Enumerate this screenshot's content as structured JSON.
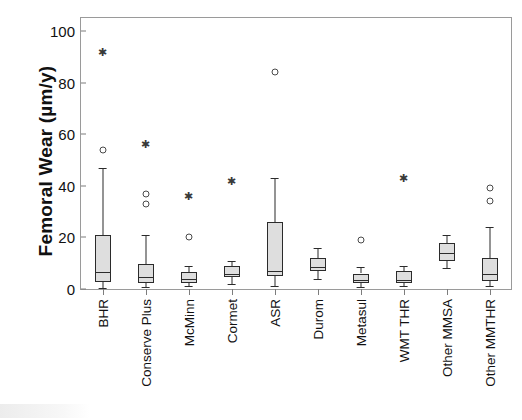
{
  "chart_data": {
    "type": "box",
    "title": "",
    "xlabel": "",
    "ylabel": "Femoral Wear (µm/y)",
    "ylim": [
      0,
      105
    ],
    "yticks": [
      0,
      20,
      40,
      60,
      80,
      100
    ],
    "ytick_labels": [
      "0",
      "20",
      "40",
      "60",
      "80",
      "100"
    ],
    "grid": false,
    "legend": "none",
    "categories": [
      "BHR",
      "Conserve Plus",
      "McMinn",
      "Cormet",
      "ASR",
      "Durom",
      "Metasul",
      "WMT THR",
      "Other MMSA",
      "Other MMTHR"
    ],
    "boxes": [
      {
        "category": "BHR",
        "whisker_low": 0.5,
        "q1": 2.7,
        "median": 6.5,
        "q3": 21.0,
        "whisker_high": 47.0,
        "outliers_circle": [
          54.0
        ],
        "outliers_star": [
          92.0
        ]
      },
      {
        "category": "Conserve Plus",
        "whisker_low": 0.8,
        "q1": 2.4,
        "median": 4.8,
        "q3": 9.5,
        "whisker_high": 21.0,
        "outliers_circle": [
          33.0,
          37.0
        ],
        "outliers_star": [
          56.0
        ]
      },
      {
        "category": "McMinn",
        "whisker_low": 1.0,
        "q1": 2.5,
        "median": 4.0,
        "q3": 6.5,
        "whisker_high": 9.0,
        "outliers_circle": [
          20.0
        ],
        "outliers_star": [
          36.0
        ]
      },
      {
        "category": "Cormet",
        "whisker_low": 2.0,
        "q1": 4.5,
        "median": 6.0,
        "q3": 9.0,
        "whisker_high": 11.0,
        "outliers_circle": [],
        "outliers_star": [
          42.0
        ]
      },
      {
        "category": "ASR",
        "whisker_low": 1.0,
        "q1": 5.0,
        "median": 7.0,
        "q3": 26.0,
        "whisker_high": 43.0,
        "outliers_circle": [
          84.0
        ],
        "outliers_star": []
      },
      {
        "category": "Durom",
        "whisker_low": 4.0,
        "q1": 7.0,
        "median": 8.5,
        "q3": 12.0,
        "whisker_high": 16.0,
        "outliers_circle": [],
        "outliers_star": []
      },
      {
        "category": "Metasul",
        "whisker_low": 0.8,
        "q1": 2.2,
        "median": 3.5,
        "q3": 6.0,
        "whisker_high": 8.5,
        "outliers_circle": [
          19.0
        ],
        "outliers_star": []
      },
      {
        "category": "WMT THR",
        "whisker_low": 1.0,
        "q1": 2.5,
        "median": 3.6,
        "q3": 7.0,
        "whisker_high": 9.0,
        "outliers_circle": [],
        "outliers_star": [
          43.0
        ]
      },
      {
        "category": "Other MMSA",
        "whisker_low": 8.0,
        "q1": 11.0,
        "median": 14.0,
        "q3": 18.0,
        "whisker_high": 21.0,
        "outliers_circle": [],
        "outliers_star": []
      },
      {
        "category": "Other MMTHR",
        "whisker_low": 1.0,
        "q1": 3.0,
        "median": 6.0,
        "q3": 12.0,
        "whisker_high": 24.0,
        "outliers_circle": [
          34.0,
          39.0
        ],
        "outliers_star": []
      }
    ],
    "colors": {
      "box_fill": "#dedede",
      "box_edge": "#2b2b2b",
      "axis": "#9a9a9a",
      "text": "#111111"
    }
  }
}
